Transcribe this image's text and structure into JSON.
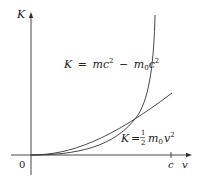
{
  "figure": {
    "axes": {
      "y_label": "K",
      "x_label": "v",
      "origin_label": "0",
      "x_tick_label": "c"
    },
    "curves": [
      {
        "name": "relativistic",
        "label_parts": {
          "lhs": "K",
          "eq": "=",
          "m": "m",
          "c1": "c",
          "exp1": "2",
          "minus": "−",
          "m0": "m",
          "sub0": "0",
          "c2": "c",
          "exp2": "2"
        },
        "label_text": "K = mc² − m₀c²"
      },
      {
        "name": "classical",
        "label_parts": {
          "lhs": "K",
          "eq": "=",
          "num": "1",
          "den": "2",
          "m": "m",
          "sub0": "0",
          "v": "v",
          "exp": "2"
        },
        "label_text": "K = ½ m₀v²"
      }
    ],
    "colors": {
      "axis": "#333333",
      "curve": "#333333",
      "background": "#ffffff"
    }
  }
}
